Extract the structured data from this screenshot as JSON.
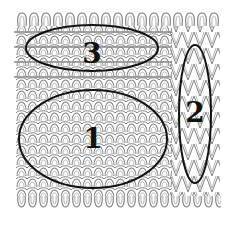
{
  "diagram": {
    "regions": [
      {
        "label": "1",
        "cx": 93,
        "cy": 139,
        "rx": 74,
        "ry": 49,
        "desc": "plain jersey loops"
      },
      {
        "label": "2",
        "cx": 195,
        "cy": 114,
        "rx": 16,
        "ry": 69,
        "desc": "elongated / tuck loops column"
      },
      {
        "label": "3",
        "cx": 92,
        "cy": 48,
        "rx": 66,
        "ry": 23,
        "desc": "rows with inlaid horizontal threads"
      }
    ],
    "colors": {
      "loop_stroke": "#7a7a7a",
      "ellipse_stroke": "#111111",
      "background": "#ffffff"
    }
  }
}
